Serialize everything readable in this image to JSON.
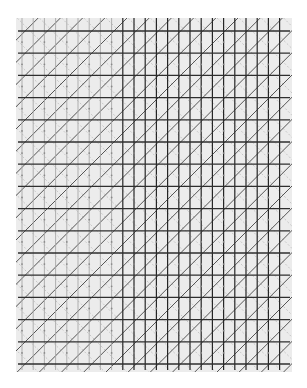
{
  "image": {
    "description": "Graph-paper style pattern: gray panel with horizontal, vertical and diagonal ruled lines; verticals darker on right side",
    "width": 307,
    "height": 388
  },
  "grid": {
    "panel": {
      "x": 16,
      "y": 18,
      "w": 276,
      "h": 354,
      "fill": "#ececec"
    },
    "horizontal": {
      "start_y": 31,
      "end_y": 364,
      "spacing": 22.2,
      "color": "#2e2e2e",
      "width": 1.3
    },
    "vertical": {
      "start_x": 22,
      "end_x": 290,
      "spacing": 11.2,
      "split_x": 116,
      "light_color": "#a8a8a8",
      "dark_color": "#262626",
      "width": 1.2
    },
    "diagonal_up": {
      "spacing": 22.2,
      "color": "#555555",
      "width": 1.0
    },
    "diagonal_down": {
      "spacing": 22.2,
      "color": "#bdbdbd",
      "width": 0.8,
      "dash": "2,2"
    },
    "dots": {
      "color": "#8a8a8a",
      "r": 0.9
    }
  }
}
